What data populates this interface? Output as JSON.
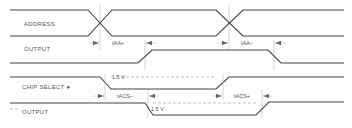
{
  "diagram": {
    "type": "timing-diagram",
    "signals": [
      {
        "id": "address",
        "label": "ADDRESS"
      },
      {
        "id": "output1",
        "label": "OUTPUT"
      },
      {
        "id": "chip_select",
        "label": "CHIP SELECT ●"
      },
      {
        "id": "output2",
        "label": "OUTPUT"
      }
    ],
    "timing_labels": {
      "taa_plus": "tAA+",
      "taa_minus": "tAA−",
      "tacs_minus": "tACS−",
      "tacs_plus": "tACS+"
    },
    "thresholds": {
      "cs_threshold": "1.5 V",
      "out_threshold": "1.5 V"
    }
  }
}
